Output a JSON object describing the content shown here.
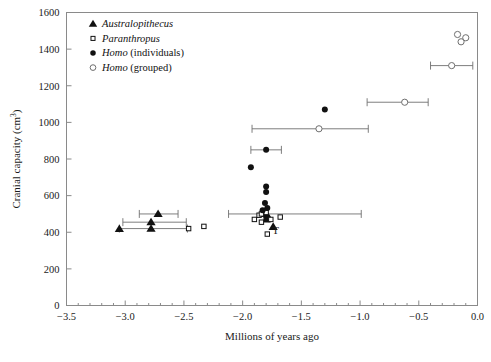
{
  "chart_data": {
    "type": "scatter",
    "title": "",
    "xlabel": "Millions of years ago",
    "ylabel": "Cranial capacity (cm³)",
    "xlim": [
      -3.5,
      0.0
    ],
    "ylim": [
      0,
      1600
    ],
    "xticks": [
      -3.5,
      -3.0,
      -2.5,
      -2.0,
      -1.5,
      -1.0,
      -0.5,
      0.0
    ],
    "xticklabels": [
      "−3.5",
      "−3.0",
      "−2.5",
      "−2.0",
      "−1.5",
      "−1.0",
      "−0.5",
      "0.0"
    ],
    "yticks": [
      0,
      200,
      400,
      600,
      800,
      1000,
      1200,
      1400,
      1600
    ],
    "yticklabels": [
      "0",
      "200",
      "400",
      "600",
      "800",
      "1000",
      "1200",
      "1400",
      "1600"
    ],
    "xminor_step": 0.1,
    "grid": false,
    "legend_position": "top-left",
    "legend": [
      {
        "marker": "filled-triangle",
        "label": "Australopithecus",
        "italic": true,
        "suffix": ""
      },
      {
        "marker": "open-square",
        "label": "Paranthropus",
        "italic": true,
        "suffix": ""
      },
      {
        "marker": "filled-circle",
        "label": "Homo",
        "italic": true,
        "suffix": " (individuals)"
      },
      {
        "marker": "open-circle",
        "label": "Homo",
        "italic": true,
        "suffix": " (grouped)"
      }
    ],
    "annotations": [
      {
        "text": "T",
        "x": -1.72,
        "y": 390
      }
    ],
    "series": [
      {
        "name": "Australopithecus",
        "marker": "filled-triangle",
        "points": [
          {
            "x": -2.72,
            "y": 500,
            "xerr_low": -2.88,
            "xerr_high": -2.55
          },
          {
            "x": -2.78,
            "y": 455,
            "xerr_low": -3.02,
            "xerr_high": -2.48
          },
          {
            "x": -2.78,
            "y": 420,
            "xerr_low": -3.05,
            "xerr_high": -2.47
          },
          {
            "x": -3.05,
            "y": 418
          },
          {
            "x": -1.74,
            "y": 430
          },
          {
            "x": -1.8,
            "y": 470
          },
          {
            "x": -1.79,
            "y": 492
          },
          {
            "x": -1.84,
            "y": 500
          }
        ]
      },
      {
        "name": "Paranthropus",
        "marker": "open-square",
        "points": [
          {
            "x": -2.46,
            "y": 420
          },
          {
            "x": -2.33,
            "y": 432
          },
          {
            "x": -1.9,
            "y": 470
          },
          {
            "x": -1.86,
            "y": 493
          },
          {
            "x": -1.84,
            "y": 455
          },
          {
            "x": -1.8,
            "y": 508
          },
          {
            "x": -1.76,
            "y": 470
          },
          {
            "x": -1.79,
            "y": 390
          },
          {
            "x": -1.68,
            "y": 483
          },
          {
            "x": -1.84,
            "y": 500,
            "xerr_low": -2.12,
            "xerr_high": -0.99
          }
        ]
      },
      {
        "name": "Homo (individuals)",
        "marker": "filled-circle",
        "points": [
          {
            "x": -1.3,
            "y": 1070
          },
          {
            "x": -1.8,
            "y": 850,
            "xerr_low": -1.93,
            "xerr_high": -1.67
          },
          {
            "x": -1.93,
            "y": 755
          },
          {
            "x": -1.8,
            "y": 650
          },
          {
            "x": -1.8,
            "y": 620
          },
          {
            "x": -1.81,
            "y": 560
          },
          {
            "x": -1.79,
            "y": 533
          },
          {
            "x": -1.83,
            "y": 520
          }
        ]
      },
      {
        "name": "Homo (grouped)",
        "marker": "open-circle",
        "points": [
          {
            "x": -0.17,
            "y": 1480
          },
          {
            "x": -0.1,
            "y": 1462
          },
          {
            "x": -0.14,
            "y": 1440
          },
          {
            "x": -0.22,
            "y": 1310,
            "xerr_low": -0.4,
            "xerr_high": -0.04
          },
          {
            "x": -0.62,
            "y": 1110,
            "xerr_low": -0.94,
            "xerr_high": -0.42
          },
          {
            "x": -1.35,
            "y": 965,
            "xerr_low": -1.92,
            "xerr_high": -0.93
          }
        ]
      }
    ]
  }
}
